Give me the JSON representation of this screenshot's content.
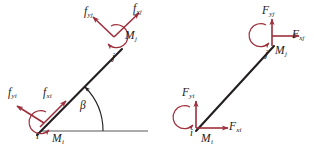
{
  "figure": {
    "background_color": "#ffffff",
    "member_color": "#231f20",
    "arrow_color": "#9e2f3c",
    "label_color": "#1a1a1a",
    "ground_color": "#57585a"
  },
  "panels": [
    {
      "id": "local",
      "name": "local-coordinate-free-body-diagram",
      "description": "Member inclined at angle beta with end forces resolved along the member local axes",
      "nodes": [
        {
          "key": "i",
          "label": "i",
          "x": 41,
          "y": 131
        },
        {
          "key": "j",
          "label": "j",
          "x": 117,
          "y": 54
        }
      ],
      "angle": {
        "label": "β",
        "name": "beta",
        "value_deg": 45
      },
      "force_labels": [
        {
          "key": "fxi",
          "base": "f",
          "sub": "xi"
        },
        {
          "key": "fyi",
          "base": "f",
          "sub": "yi"
        },
        {
          "key": "mi",
          "base": "M",
          "sub": "i"
        },
        {
          "key": "fxj",
          "base": "f",
          "sub": "xj"
        },
        {
          "key": "fyj",
          "base": "f",
          "sub": "yj"
        },
        {
          "key": "mj",
          "base": "M",
          "sub": "j"
        }
      ]
    },
    {
      "id": "global",
      "name": "global-coordinate-free-body-diagram",
      "description": "Same member with end forces resolved along the global horizontal and vertical axes",
      "nodes": [
        {
          "key": "i",
          "label": "i",
          "x": 196,
          "y": 128
        },
        {
          "key": "j",
          "label": "j",
          "x": 272,
          "y": 50
        }
      ],
      "force_labels": [
        {
          "key": "Fxi",
          "base": "F",
          "sub": "xi"
        },
        {
          "key": "Fyi",
          "base": "F",
          "sub": "yi"
        },
        {
          "key": "Mi",
          "base": "M",
          "sub": "i"
        },
        {
          "key": "Fxj",
          "base": "F",
          "sub": "xj"
        },
        {
          "key": "Fyj",
          "base": "F",
          "sub": "yj"
        },
        {
          "key": "Mj",
          "base": "M",
          "sub": "j"
        }
      ]
    }
  ],
  "labels": {
    "local": {
      "fxi_base": "f",
      "fxi_sub": "xi",
      "fyi_base": "f",
      "fyi_sub": "yi",
      "mi_base": "M",
      "mi_sub": "i",
      "fxj_base": "f",
      "fxj_sub": "xj",
      "fyj_base": "f",
      "fyj_sub": "yj",
      "mj_base": "M",
      "mj_sub": "j",
      "node_i": "i",
      "node_j": "j",
      "beta": "β"
    },
    "global": {
      "fxi_base": "F",
      "fxi_sub": "xi",
      "fyi_base": "F",
      "fyi_sub": "yi",
      "mi_base": "M",
      "mi_sub": "i",
      "fxj_base": "F",
      "fxj_sub": "xj",
      "fyj_base": "F",
      "fyj_sub": "yj",
      "mj_base": "M",
      "mj_sub": "j",
      "node_i": "i",
      "node_j": "j"
    }
  }
}
